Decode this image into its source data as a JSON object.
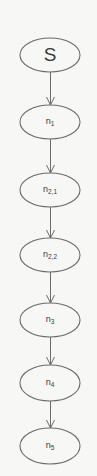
{
  "diagram": {
    "type": "flowchart",
    "direction": "top-to-bottom",
    "colors": {
      "background": "#f7f7f5",
      "stroke": "#6b6b6b",
      "text": "#3a3a3a"
    },
    "nodes": [
      {
        "id": "S",
        "base": "S",
        "sub": "",
        "shape": "ellipse",
        "cx": 50,
        "cy": 55,
        "rx": 30,
        "ry": 17
      },
      {
        "id": "n1",
        "base": "n",
        "sub": "1",
        "shape": "ellipse",
        "cx": 50,
        "cy": 122,
        "rx": 30,
        "ry": 17
      },
      {
        "id": "n2_1",
        "base": "n",
        "sub": "2,1",
        "shape": "ellipse",
        "cx": 50,
        "cy": 190,
        "rx": 30,
        "ry": 17
      },
      {
        "id": "n2_2",
        "base": "n",
        "sub": "2,2",
        "shape": "ellipse",
        "cx": 50,
        "cy": 255,
        "rx": 30,
        "ry": 17
      },
      {
        "id": "n3",
        "base": "n",
        "sub": "3",
        "shape": "ellipse",
        "cx": 50,
        "cy": 320,
        "rx": 30,
        "ry": 17
      },
      {
        "id": "n4",
        "base": "n",
        "sub": "4",
        "shape": "ellipse",
        "cx": 50,
        "cy": 383,
        "rx": 30,
        "ry": 18
      },
      {
        "id": "n5",
        "base": "n",
        "sub": "5",
        "shape": "ellipse",
        "cx": 50,
        "cy": 446,
        "rx": 30,
        "ry": 18
      }
    ],
    "edges": [
      {
        "from": "S",
        "to": "n1"
      },
      {
        "from": "n1",
        "to": "n2_1"
      },
      {
        "from": "n2_1",
        "to": "n2_2"
      },
      {
        "from": "n2_2",
        "to": "n3"
      },
      {
        "from": "n3",
        "to": "n4"
      },
      {
        "from": "n4",
        "to": "n5"
      }
    ]
  }
}
